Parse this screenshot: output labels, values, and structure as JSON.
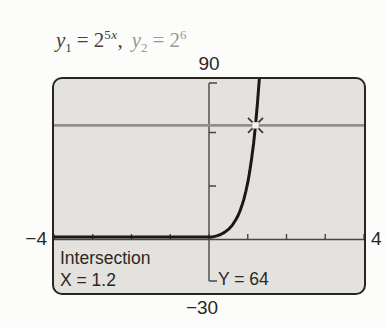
{
  "header": {
    "eq1": {
      "var": "y",
      "sub": "1",
      "rel": "=",
      "base": "2",
      "sup_num": "5",
      "sup_var": "x"
    },
    "separator": ",",
    "eq2": {
      "var": "y",
      "sub": "2",
      "rel": "=",
      "base": "2",
      "sup_num": "6",
      "sup_var": ""
    }
  },
  "readout": {
    "title": "Intersection",
    "x": "X = 1.2",
    "y": "Y = 64"
  },
  "chart_data": {
    "type": "line",
    "xlim": [
      -4,
      4
    ],
    "ylim": [
      -30,
      90
    ],
    "xscl": 1,
    "yscl": 30,
    "grid": false,
    "xmin_label": "−4",
    "xmax_label": "4",
    "ymin_label": "−30",
    "ymax_label": "90",
    "series": [
      {
        "name": "y1 = 2^(5x)",
        "type": "curve",
        "color": "#1b1915",
        "x": [
          -4,
          -3,
          -2,
          -1.5,
          -1,
          -0.7,
          -0.5,
          -0.3,
          -0.1,
          0,
          0.1,
          0.2,
          0.3,
          0.4,
          0.5,
          0.6,
          0.7,
          0.75,
          0.8,
          0.85,
          0.9,
          0.95,
          1.0,
          1.05,
          1.1,
          1.15,
          1.2,
          1.25,
          1.3,
          1.33
        ],
        "y": [
          0,
          0,
          0.001,
          0.006,
          0.031,
          0.088,
          0.177,
          0.354,
          0.707,
          1,
          1.414,
          2,
          2.828,
          4,
          5.657,
          8,
          11.314,
          13.454,
          16,
          19.027,
          22.627,
          26.909,
          32,
          38.055,
          45.255,
          53.817,
          64,
          76.109,
          90.51,
          100.43
        ]
      },
      {
        "name": "y2 = 2^6",
        "type": "hline",
        "color": "#918f8b",
        "y": 64
      }
    ],
    "intersection": {
      "x": 1.2,
      "y": 64,
      "label_x": "X = 1.2",
      "label_y": "Y = 64"
    },
    "colors": {
      "screen_bg": "#e4e2de",
      "border": "#29261f",
      "axis": "#4a4743",
      "curve": "#1b1915",
      "hline": "#918f8b",
      "text": "#2b2824",
      "marker_ray": "#3c3936",
      "marker_center": "#f4f3f0"
    }
  }
}
